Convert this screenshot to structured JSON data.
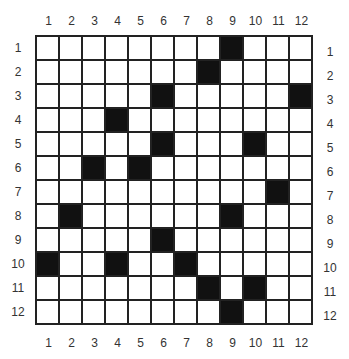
{
  "puzzle": {
    "rows": 12,
    "cols": 12,
    "column_labels": [
      "1",
      "2",
      "3",
      "4",
      "5",
      "6",
      "7",
      "8",
      "9",
      "10",
      "11",
      "12"
    ],
    "row_labels": [
      "1",
      "2",
      "3",
      "4",
      "5",
      "6",
      "7",
      "8",
      "9",
      "10",
      "11",
      "12"
    ],
    "black_cells": [
      [
        1,
        9
      ],
      [
        2,
        8
      ],
      [
        3,
        6
      ],
      [
        3,
        12
      ],
      [
        4,
        4
      ],
      [
        5,
        6
      ],
      [
        5,
        10
      ],
      [
        6,
        3
      ],
      [
        6,
        5
      ],
      [
        7,
        11
      ],
      [
        8,
        2
      ],
      [
        8,
        9
      ],
      [
        9,
        6
      ],
      [
        10,
        1
      ],
      [
        10,
        4
      ],
      [
        10,
        7
      ],
      [
        11,
        8
      ],
      [
        11,
        10
      ],
      [
        12,
        9
      ]
    ],
    "colors": {
      "black": "#111111",
      "white": "#ffffff",
      "grid_line": "#222222"
    }
  }
}
